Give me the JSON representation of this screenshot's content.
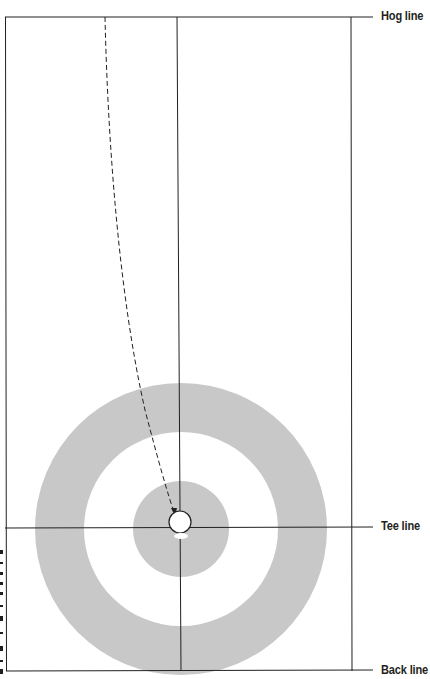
{
  "diagram": {
    "labels": {
      "hog_line": "Hog line",
      "tee_line": "Tee line",
      "back_line": "Back line"
    },
    "colors": {
      "ring_fill": "#c8c8c8",
      "line": "#231f20",
      "background": "#ffffff"
    },
    "house": {
      "center": [
        181,
        529
      ],
      "radii": {
        "twelve_foot": 146,
        "eight_foot": 97,
        "four_foot": 48,
        "button_stone": 11
      }
    },
    "path": {
      "style": "dashed",
      "from": [
        105,
        17
      ],
      "to": [
        175,
        516
      ],
      "arrowhead": true
    }
  }
}
